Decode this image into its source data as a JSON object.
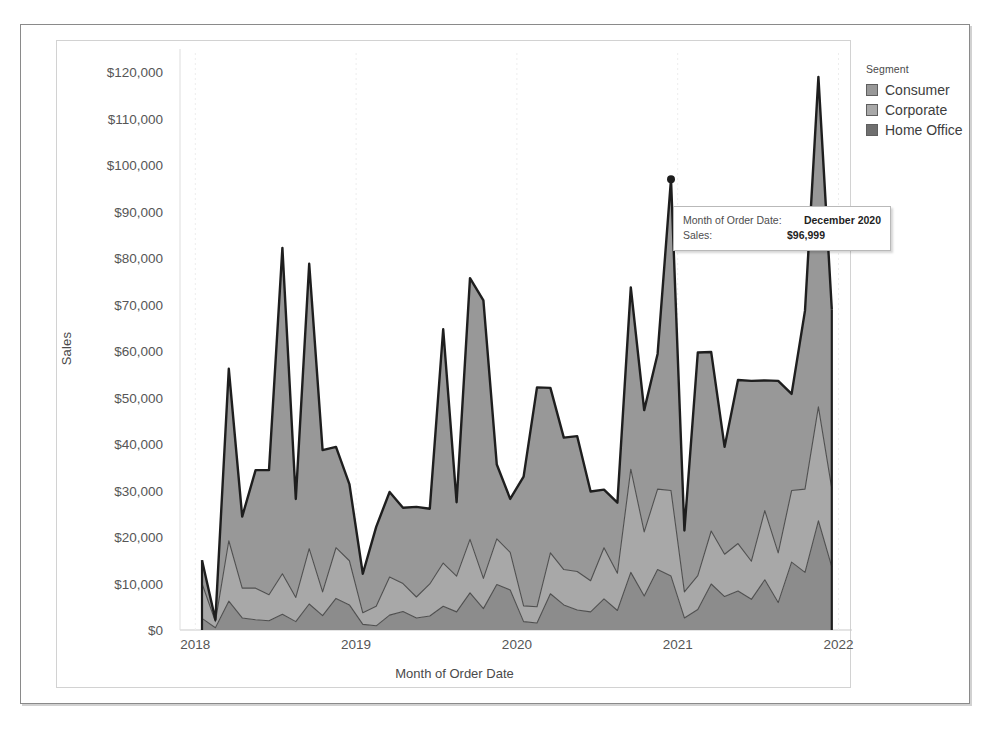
{
  "chart_data": {
    "type": "area",
    "stacked": true,
    "title": "",
    "xlabel": "Month of Order Date",
    "ylabel": "Sales",
    "ylim": [
      0,
      125000
    ],
    "yticks": [
      "$0",
      "$10,000",
      "$20,000",
      "$30,000",
      "$40,000",
      "$50,000",
      "$60,000",
      "$70,000",
      "$80,000",
      "$90,000",
      "$100,000",
      "$110,000",
      "$120,000"
    ],
    "ytick_values": [
      0,
      10000,
      20000,
      30000,
      40000,
      50000,
      60000,
      70000,
      80000,
      90000,
      100000,
      110000,
      120000
    ],
    "xticks": [
      "2018",
      "2019",
      "2020",
      "2021",
      "2022"
    ],
    "xtick_values": [
      2018,
      2019,
      2020,
      2021,
      2022
    ],
    "grid": false,
    "legend_position": "right",
    "x": [
      "January 2018",
      "February 2018",
      "March 2018",
      "April 2018",
      "May 2018",
      "June 2018",
      "July 2018",
      "August 2018",
      "September 2018",
      "October 2018",
      "November 2018",
      "December 2018",
      "January 2019",
      "February 2019",
      "March 2019",
      "April 2019",
      "May 2019",
      "June 2019",
      "July 2019",
      "August 2019",
      "September 2019",
      "October 2019",
      "November 2019",
      "December 2019",
      "January 2020",
      "February 2020",
      "March 2020",
      "April 2020",
      "May 2020",
      "June 2020",
      "July 2020",
      "August 2020",
      "September 2020",
      "October 2020",
      "November 2020",
      "December 2020",
      "January 2021",
      "February 2021",
      "March 2021",
      "April 2021",
      "May 2021",
      "June 2021",
      "July 2021",
      "August 2021",
      "September 2021",
      "October 2021",
      "November 2021",
      "December 2021"
    ],
    "series": [
      {
        "name": "Home Office",
        "color": "#8c8c8c",
        "values": [
          2500,
          500,
          6200,
          2600,
          2200,
          2000,
          3400,
          1800,
          5600,
          3100,
          6800,
          5400,
          1200,
          900,
          3200,
          4000,
          2600,
          3000,
          5100,
          3900,
          8000,
          4600,
          9800,
          8600,
          1800,
          1500,
          7800,
          5400,
          4300,
          3900,
          6700,
          4200,
          12400,
          7300,
          13000,
          11600,
          2600,
          4400,
          9900,
          7200,
          8400,
          6600,
          10800,
          5900,
          14600,
          12400,
          23500,
          13600
        ]
      },
      {
        "name": "Corporate",
        "color": "#a8a8a8",
        "values": [
          7500,
          1300,
          13000,
          6400,
          6800,
          5600,
          8700,
          5200,
          11900,
          5100,
          10900,
          9500,
          2500,
          4200,
          8200,
          6000,
          4500,
          6900,
          9300,
          7700,
          11500,
          6500,
          9800,
          8100,
          3400,
          3500,
          8800,
          7600,
          8300,
          6700,
          11000,
          8000,
          22200,
          13800,
          17300,
          18400,
          5600,
          7300,
          11400,
          9100,
          10200,
          8200,
          14900,
          10700,
          15400,
          17900,
          24500,
          16800
        ]
      },
      {
        "name": "Consumer",
        "color": "#989898",
        "values": [
          5000,
          400,
          37000,
          15400,
          25400,
          26800,
          70100,
          21200,
          61300,
          30500,
          21700,
          16500,
          8400,
          17100,
          18300,
          16300,
          19400,
          16200,
          50300,
          15900,
          56200,
          59800,
          16000,
          11500,
          27800,
          47200,
          35500,
          28400,
          29100,
          19200,
          12500,
          15200,
          39100,
          26200,
          29100,
          66999,
          13200,
          48000,
          38500,
          23100,
          35200,
          38800,
          28000,
          37000,
          20800,
          38400,
          71000,
          38600
        ]
      }
    ],
    "highlighted_point": {
      "label": "December 2020",
      "value": 96999,
      "value_label": "$96,999"
    }
  },
  "legend": {
    "title": "Segment",
    "items": [
      {
        "label": "Consumer",
        "color": "#989898"
      },
      {
        "label": "Corporate",
        "color": "#a8a8a8"
      },
      {
        "label": "Home Office",
        "color": "#6f6f6f"
      }
    ]
  },
  "axes": {
    "y_title": "Sales",
    "x_title": "Month of Order Date"
  },
  "tooltip": {
    "date_key": "Month of Order Date:",
    "date_value": "December 2020",
    "sales_key": "Sales:",
    "sales_value": "$96,999"
  },
  "colors": {
    "consumer": "#989898",
    "corporate": "#a8a8a8",
    "home_office": "#6f6f6f",
    "line": "#1e1e1e",
    "axis_text": "#565656",
    "frame": "#8a8a8a"
  }
}
